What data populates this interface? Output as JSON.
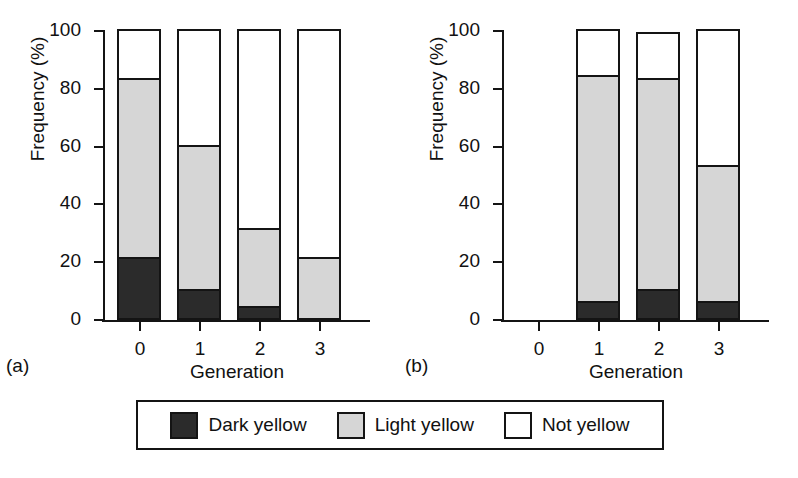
{
  "chart_data": {
    "type": "bar",
    "title": "",
    "subtitle": "",
    "stacked": true,
    "panels": [
      {
        "tag": "(a)",
        "xlabel": "Generation",
        "ylabel": "Frequency (%)",
        "categories": [
          "0",
          "1",
          "2",
          "3"
        ],
        "ylim": [
          0,
          100
        ],
        "yticks": [
          0,
          20,
          40,
          60,
          80,
          100
        ],
        "yticklabels": [
          "0",
          "20",
          "40",
          "60",
          "80",
          "100"
        ],
        "grid": false,
        "series": [
          {
            "name": "Dark yellow",
            "values": [
              21,
              10,
              4,
              0
            ]
          },
          {
            "name": "Light yellow",
            "values": [
              62,
              50,
              27,
              21
            ]
          },
          {
            "name": "Not yellow",
            "values": [
              17,
              40,
              69,
              79
            ]
          }
        ],
        "cumulative_tops": [
          {
            "dark": 21,
            "light": 83,
            "total": 100
          },
          {
            "dark": 10,
            "light": 60,
            "total": 100
          },
          {
            "dark": 4,
            "light": 31,
            "total": 100
          },
          {
            "dark": 0,
            "light": 21,
            "total": 100
          }
        ]
      },
      {
        "tag": "(b)",
        "xlabel": "Generation",
        "ylabel": "Frequency (%)",
        "categories": [
          "0",
          "1",
          "2",
          "3"
        ],
        "ylim": [
          0,
          100
        ],
        "yticks": [
          0,
          20,
          40,
          60,
          80,
          100
        ],
        "yticklabels": [
          "0",
          "20",
          "40",
          "60",
          "80",
          "100"
        ],
        "grid": false,
        "series": [
          {
            "name": "Dark yellow",
            "values": [
              0,
              6,
              10,
              6
            ]
          },
          {
            "name": "Light yellow",
            "values": [
              0,
              78,
              73,
              47
            ]
          },
          {
            "name": "Not yellow",
            "values": [
              0,
              16,
              16,
              47
            ]
          }
        ],
        "cumulative_tops": [
          {
            "dark": 0,
            "light": 0,
            "total": 0
          },
          {
            "dark": 6,
            "light": 84,
            "total": 100
          },
          {
            "dark": 10,
            "light": 83,
            "total": 99
          },
          {
            "dark": 6,
            "light": 53,
            "total": 100
          }
        ]
      }
    ],
    "legend": {
      "position": "bottom",
      "entries": [
        {
          "label": "Dark yellow",
          "color": "#2b2b2b"
        },
        {
          "label": "Light yellow",
          "color": "#d6d6d6"
        },
        {
          "label": "Not yellow",
          "color": "#ffffff"
        }
      ]
    }
  },
  "panel_a": {
    "tag": "(a)",
    "ylabel": "Frequency (%)",
    "xlabel": "Generation",
    "yticklabels": [
      "100",
      "80",
      "60",
      "40",
      "20",
      "0"
    ],
    "xticklabels": [
      "0",
      "1",
      "2",
      "3"
    ]
  },
  "panel_b": {
    "tag": "(b)",
    "ylabel": "Frequency (%)",
    "xlabel": "Generation",
    "yticklabels": [
      "100",
      "80",
      "60",
      "40",
      "20",
      "0"
    ],
    "xticklabels": [
      "0",
      "1",
      "2",
      "3"
    ]
  },
  "legend": {
    "items": [
      {
        "label": "Dark yellow"
      },
      {
        "label": "Light yellow"
      },
      {
        "label": "Not yellow"
      }
    ]
  }
}
